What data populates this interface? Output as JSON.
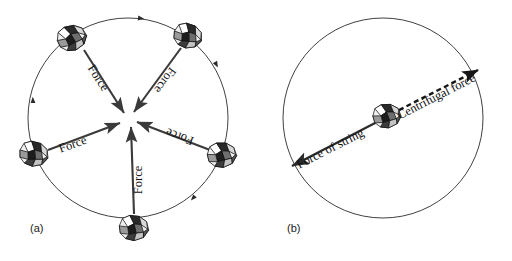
{
  "figure": {
    "background_color": "#ffffff",
    "ink_color": "#1a1a1a"
  },
  "panels": [
    {
      "id": "panel-a",
      "label": "(a)",
      "label_pos": {
        "x": 30,
        "y": 232
      },
      "caption_role": "centripetal-forces-on-whirling-object",
      "circle": {
        "cx": 128,
        "cy": 118,
        "r": 100,
        "stroke": "#2b2b2b"
      },
      "center_point": {
        "x": 128,
        "y": 118
      },
      "motion_direction": "clockwise",
      "arrow_label_text": "Force",
      "objects": [
        {
          "name": "rock-top-left",
          "angle_deg": 198,
          "rock": {
            "x": 72,
            "y": 38,
            "rx": 15,
            "ry": 12,
            "rot": -18
          },
          "arrow": {
            "x1": 84,
            "y1": 50,
            "x2": 124,
            "y2": 113
          },
          "label": "Force",
          "label_pos": {
            "x": 95,
            "y": 80
          },
          "label_rot": 57,
          "label_flip": false
        },
        {
          "name": "rock-top-right",
          "angle_deg": 306,
          "rock": {
            "x": 188,
            "y": 36,
            "rx": 14,
            "ry": 12,
            "rot": 12
          },
          "arrow": {
            "x1": 181,
            "y1": 48,
            "x2": 134,
            "y2": 112
          },
          "label": "Force",
          "label_pos": {
            "x": 162,
            "y": 78
          },
          "label_rot": -54,
          "label_flip": true
        },
        {
          "name": "rock-left",
          "angle_deg": 126,
          "rock": {
            "x": 34,
            "y": 154,
            "rx": 15,
            "ry": 11,
            "rot": 8
          },
          "arrow": {
            "x1": 48,
            "y1": 150,
            "x2": 120,
            "y2": 123
          },
          "label": "Force",
          "label_pos": {
            "x": 74,
            "y": 148
          },
          "label_rot": -20,
          "label_flip": false
        },
        {
          "name": "rock-right",
          "angle_deg": 54,
          "rock": {
            "x": 222,
            "y": 155,
            "rx": 15,
            "ry": 12,
            "rot": -6
          },
          "arrow": {
            "x1": 210,
            "y1": 150,
            "x2": 137,
            "y2": 122
          },
          "label": "Force",
          "label_pos": {
            "x": 181,
            "y": 133
          },
          "label_rot": 20,
          "label_flip": true
        },
        {
          "name": "rock-bottom",
          "angle_deg": 90,
          "rock": {
            "x": 134,
            "y": 228,
            "rx": 14,
            "ry": 13,
            "rot": 0
          },
          "arrow": {
            "x1": 134,
            "y1": 214,
            "x2": 131,
            "y2": 127
          },
          "label": "Force",
          "label_pos": {
            "x": 142,
            "y": 180
          },
          "label_rot": -90,
          "label_flip": false
        }
      ],
      "tangent_markers": [
        {
          "x": 138,
          "y": 18,
          "rot": 8
        },
        {
          "x": 215,
          "y": 62,
          "rot": 62
        },
        {
          "x": 195,
          "y": 196,
          "rot": 132
        },
        {
          "x": 33,
          "y": 103,
          "rot": 268
        }
      ]
    },
    {
      "id": "panel-b",
      "label": "(b)",
      "label_pos": {
        "x": 287,
        "y": 232
      },
      "caption_role": "string-force-versus-centrifugal-force",
      "circle": {
        "cx": 383,
        "cy": 118,
        "r": 100,
        "stroke": "#2b2b2b"
      },
      "objects": [
        {
          "name": "rock-center",
          "rock": {
            "x": 387,
            "y": 116,
            "rx": 14,
            "ry": 12,
            "rot": -8
          }
        }
      ],
      "vectors": [
        {
          "name": "force-of-string-arrow",
          "style": "solid",
          "label": "Force of string",
          "from": {
            "x": 377,
            "y": 122
          },
          "to": {
            "x": 292,
            "y": 166
          },
          "label_pos": {
            "x": 332,
            "y": 152
          },
          "label_rot": -27
        },
        {
          "name": "centrifugal-force-arrow",
          "style": "dashed",
          "label": "Centrifugal force",
          "from": {
            "x": 399,
            "y": 110
          },
          "to": {
            "x": 478,
            "y": 70
          },
          "label_pos": {
            "x": 438,
            "y": 100
          },
          "label_rot": -27
        }
      ]
    }
  ]
}
